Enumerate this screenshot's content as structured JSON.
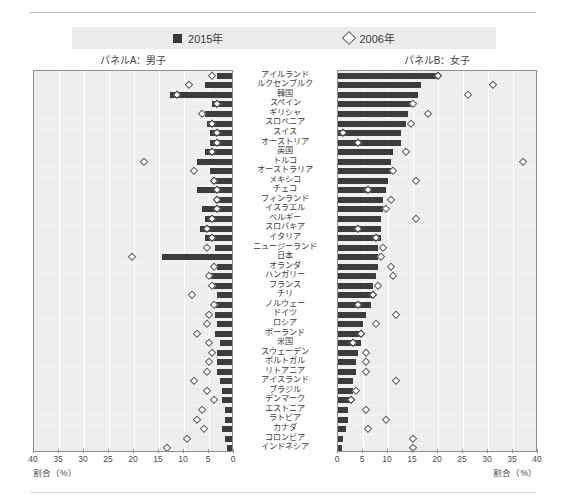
{
  "legend": {
    "series": [
      {
        "key": "2015",
        "label": "2015年",
        "marker": "filled-square",
        "color": "#3c3c3c"
      },
      {
        "key": "2006",
        "label": "2006年",
        "marker": "open-diamond",
        "color": "#5a5a5a"
      }
    ]
  },
  "panels": {
    "left": {
      "title": "パネルA：男子",
      "axis_label": "割合（%）",
      "direction": "reversed"
    },
    "right": {
      "title": "パネルB：女子",
      "axis_label": "割合（%）",
      "direction": "normal"
    }
  },
  "axis": {
    "ticks_left": [
      "40",
      "35",
      "30",
      "25",
      "20",
      "15",
      "10",
      "5",
      "0"
    ],
    "ticks_right": [
      "0",
      "5",
      "10",
      "15",
      "20",
      "25",
      "30",
      "35",
      "40"
    ]
  },
  "chart_data": {
    "type": "bar",
    "title": "",
    "subtitle": "",
    "xlabel": "割合（%）",
    "ylabel": "",
    "xlim": [
      0,
      40
    ],
    "grid": true,
    "legend_position": "top-center",
    "orientation": "horizontal",
    "layout": "butterfly-two-panel",
    "categories": [
      "アイルランド",
      "ルクセンブルク",
      "韓国",
      "スペイン",
      "ギリシャ",
      "スロベニア",
      "スイス",
      "オーストリア",
      "英国",
      "トルコ",
      "オーストラリア",
      "メキシコ",
      "チェコ",
      "フィンランド",
      "イスラエル",
      "ベルギー",
      "スロバキア",
      "イタリア",
      "ニュージーランド",
      "日本",
      "オランダ",
      "ハンガリー",
      "フランス",
      "チリ",
      "ノルウェー",
      "ドイツ",
      "ロシア",
      "ポーランド",
      "米国",
      "スウェーデン",
      "ポルトガル",
      "リトアニア",
      "アイスランド",
      "ブラジル",
      "デンマーク",
      "エストニア",
      "ラトビア",
      "カナダ",
      "コロンビア",
      "インドネシア"
    ],
    "panels": [
      {
        "name": "パネルA：男子",
        "axis_reversed": true,
        "series": [
          {
            "name": "2015年",
            "marker": "bar",
            "values": [
              3.0,
              5.5,
              12.5,
              4.0,
              5.5,
              5.0,
              4.5,
              4.5,
              5.5,
              7.0,
              4.5,
              4.0,
              7.0,
              3.5,
              6.0,
              5.5,
              6.5,
              5.5,
              3.5,
              14.0,
              3.0,
              4.5,
              4.0,
              3.0,
              3.5,
              3.5,
              3.0,
              3.5,
              2.5,
              3.0,
              3.0,
              3.0,
              2.5,
              2.0,
              2.0,
              1.5,
              1.5,
              2.0,
              1.5,
              1.0
            ]
          },
          {
            "name": "2006年",
            "marker": "diamond",
            "values": [
              4.5,
              9.0,
              11.5,
              3.5,
              6.5,
              4.5,
              3.5,
              3.5,
              4.5,
              18.0,
              8.0,
              4.0,
              3.5,
              3.5,
              3.5,
              4.5,
              5.5,
              4.5,
              5.5,
              20.5,
              4.0,
              5.0,
              4.5,
              8.5,
              4.0,
              5.0,
              5.5,
              7.5,
              5.0,
              4.5,
              5.0,
              5.5,
              8.0,
              5.5,
              4.0,
              6.5,
              7.5,
              6.0,
              9.5,
              13.5
            ]
          }
        ]
      },
      {
        "name": "パネルB：女子",
        "axis_reversed": false,
        "series": [
          {
            "name": "2015年",
            "marker": "bar",
            "values": [
              20.0,
              16.5,
              16.0,
              14.5,
              14.0,
              13.5,
              12.5,
              12.5,
              11.0,
              10.5,
              10.5,
              10.0,
              9.5,
              9.0,
              9.0,
              8.5,
              8.5,
              8.5,
              8.0,
              8.0,
              8.0,
              7.5,
              7.0,
              7.0,
              6.5,
              5.5,
              5.0,
              5.0,
              4.5,
              4.0,
              3.5,
              3.5,
              3.0,
              3.0,
              2.5,
              2.0,
              2.0,
              1.5,
              1.0,
              0.8
            ]
          },
          {
            "name": "2006年",
            "marker": "diamond",
            "values": [
              20.0,
              31.0,
              26.0,
              15.0,
              18.0,
              14.5,
              1.0,
              4.0,
              13.5,
              37.0,
              11.0,
              15.5,
              6.0,
              10.5,
              9.5,
              15.5,
              4.0,
              7.5,
              9.0,
              8.5,
              10.5,
              11.0,
              8.0,
              7.0,
              4.0,
              11.5,
              7.5,
              4.5,
              3.0,
              5.5,
              5.5,
              5.5,
              11.5,
              3.5,
              2.5,
              5.5,
              9.5,
              6.0,
              15.0,
              15.0
            ]
          }
        ]
      }
    ]
  }
}
